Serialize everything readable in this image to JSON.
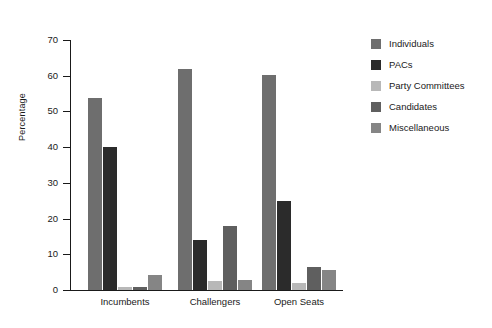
{
  "chart_data": {
    "type": "bar",
    "title": "",
    "xlabel": "",
    "ylabel": "Percentage",
    "ylim": [
      0,
      70
    ],
    "yticks": [
      0,
      10,
      20,
      30,
      40,
      50,
      60,
      70
    ],
    "ytick_labels": [
      "0",
      "10",
      "20",
      "30",
      "40",
      "50",
      "60",
      "70"
    ],
    "grid": false,
    "legend_position": "right",
    "categories": [
      "Incumbents",
      "Challengers",
      "Open Seats"
    ],
    "series": [
      {
        "name": "Individuals",
        "color": "#6e6e6e",
        "values": [
          53.8,
          61.8,
          60.2
        ]
      },
      {
        "name": "PACs",
        "color": "#2b2b2b",
        "values": [
          40.0,
          14.0,
          24.8
        ]
      },
      {
        "name": "Party Committees",
        "color": "#b8b8b8",
        "values": [
          0.9,
          2.5,
          1.9
        ]
      },
      {
        "name": "Candidates",
        "color": "#5f5f5f",
        "values": [
          0.8,
          18.0,
          6.5
        ]
      },
      {
        "name": "Miscellaneous",
        "color": "#858585",
        "values": [
          4.1,
          2.9,
          5.6
        ]
      }
    ]
  },
  "legend": {
    "items": [
      {
        "label": "Individuals"
      },
      {
        "label": "PACs"
      },
      {
        "label": "Party Committees"
      },
      {
        "label": "Candidates"
      },
      {
        "label": "Miscellaneous"
      }
    ]
  }
}
